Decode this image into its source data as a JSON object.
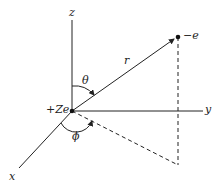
{
  "diagram": {
    "type": "spherical-coordinates",
    "axes": {
      "z": "z",
      "y": "y",
      "x": "x"
    },
    "labels": {
      "nucleus": "+Ze",
      "electron": "−e",
      "radius": "r",
      "theta": "θ",
      "phi": "ϕ"
    },
    "colors": {
      "line": "#222222",
      "background": "#ffffff"
    }
  }
}
